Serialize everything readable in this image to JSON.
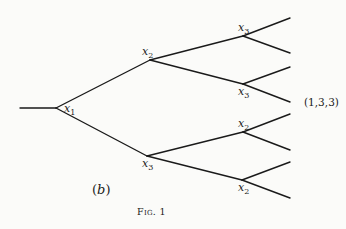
{
  "diagram": {
    "type": "game-tree",
    "root_stub": {
      "x1": 20,
      "y1": 108,
      "x2": 56,
      "y2": 108
    },
    "nodes": [
      {
        "id": "n1",
        "var": "x",
        "sub": "1",
        "x": 56,
        "y": 108,
        "label_x": 64,
        "label_y": 103
      },
      {
        "id": "n2",
        "var": "x",
        "sub": "2",
        "x": 150,
        "y": 60,
        "label_x": 142,
        "label_y": 46
      },
      {
        "id": "n3",
        "var": "x",
        "sub": "3",
        "x": 147,
        "y": 156,
        "label_x": 142,
        "label_y": 158
      },
      {
        "id": "n4",
        "var": "x",
        "sub": "3",
        "x": 243,
        "y": 36,
        "label_x": 238,
        "label_y": 22
      },
      {
        "id": "n5",
        "var": "x",
        "sub": "3",
        "x": 243,
        "y": 84,
        "label_x": 238,
        "label_y": 86
      },
      {
        "id": "n6",
        "var": "x",
        "sub": "2",
        "x": 243,
        "y": 132,
        "label_x": 238,
        "label_y": 118
      },
      {
        "id": "n7",
        "var": "x",
        "sub": "2",
        "x": 242,
        "y": 180,
        "label_x": 238,
        "label_y": 182
      }
    ],
    "edges": [
      [
        "n1",
        "n2"
      ],
      [
        "n1",
        "n3"
      ],
      [
        "n2",
        "n4"
      ],
      [
        "n2",
        "n5"
      ],
      [
        "n3",
        "n6"
      ],
      [
        "n3",
        "n7"
      ]
    ],
    "leaves": [
      {
        "from": "n4",
        "x": 290,
        "y": 18
      },
      {
        "from": "n4",
        "x": 290,
        "y": 53
      },
      {
        "from": "n5",
        "x": 290,
        "y": 67
      },
      {
        "from": "n5",
        "x": 290,
        "y": 102
      },
      {
        "from": "n6",
        "x": 290,
        "y": 114
      },
      {
        "from": "n6",
        "x": 290,
        "y": 150
      },
      {
        "from": "n7",
        "x": 290,
        "y": 162
      },
      {
        "from": "n7",
        "x": 290,
        "y": 198
      }
    ],
    "payoff_label": {
      "text": "(1,3,3)",
      "x": 304,
      "y": 97
    },
    "panel_label": {
      "open": "(",
      "letter": "b",
      "close": ")",
      "x": 92,
      "y": 183
    },
    "caption": {
      "text": "Fig. 1",
      "x": 137,
      "y": 207
    }
  }
}
